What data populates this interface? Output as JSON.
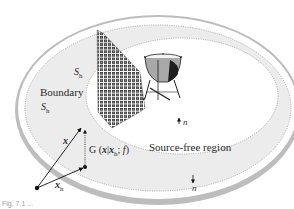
{
  "figure": {
    "labels": {
      "boundary": "Boundary",
      "surface_top": {
        "base": "S",
        "sub": "h"
      },
      "surface_left": {
        "base": "S",
        "sub": "h"
      },
      "source_free_region": "Source-free region",
      "normal_inner": "n",
      "normal_outer": "n",
      "vector_x": "x",
      "vector_xh": {
        "base": "x",
        "sub": "h"
      },
      "greens_function": {
        "prefix": "G (",
        "x": "x",
        "bar": "|",
        "xh_base": "x",
        "xh_sub": "h",
        "suffix": "; ",
        "f": "f",
        "close": ")"
      }
    },
    "caption": "Fig. 7.1 ...",
    "objects": [
      "loudspeaker-array",
      "kettle-drum"
    ],
    "colors": {
      "outer_rim": "#b9b9b9",
      "boundary_band": "#ececec",
      "inner_region": "#ffffff",
      "dotted_line": "#8a8a8a",
      "speaker_dark": "#3a3a3a",
      "arrow": "#111111"
    }
  }
}
